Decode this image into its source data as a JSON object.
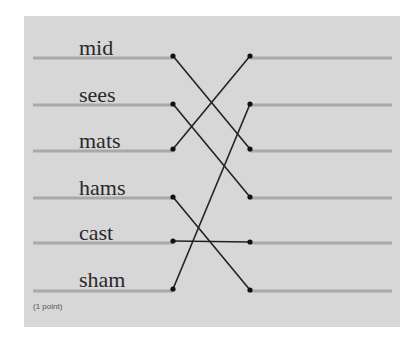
{
  "question": {
    "left_words": [
      "mid",
      "sees",
      "mats",
      "hams",
      "cast",
      "sham"
    ],
    "points_label": "(1 point)",
    "connections": [
      {
        "from": "mid",
        "from_index": 0,
        "to_index": 2
      },
      {
        "from": "sees",
        "from_index": 1,
        "to_index": 3
      },
      {
        "from": "mats",
        "from_index": 2,
        "to_index": 0
      },
      {
        "from": "hams",
        "from_index": 3,
        "to_index": 5
      },
      {
        "from": "cast",
        "from_index": 4,
        "to_index": 4
      },
      {
        "from": "sham",
        "from_index": 5,
        "to_index": 1
      }
    ]
  },
  "colors": {
    "panel_bg": "#d7d7d7",
    "guide_line": "#a9a9a9",
    "connector": "#222222",
    "text": "#2a2a2a"
  }
}
